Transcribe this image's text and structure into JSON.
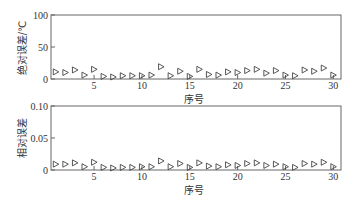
{
  "chart_data": [
    {
      "type": "scatter",
      "title": "",
      "xlabel": "序号",
      "ylabel": "绝对误差/℃",
      "xlim": [
        0.5,
        30.8
      ],
      "ylim": [
        0,
        100
      ],
      "xticks": [
        5,
        10,
        15,
        20,
        25,
        30
      ],
      "yticks": [
        0,
        50,
        100
      ],
      "ytick_labels": [
        "0",
        "50",
        "100"
      ],
      "marker": "right-triangle-open",
      "grid": false,
      "x": [
        1,
        2,
        3,
        4,
        5,
        6,
        7,
        8,
        9,
        10,
        11,
        12,
        13,
        14,
        15,
        16,
        17,
        18,
        19,
        20,
        21,
        22,
        23,
        24,
        25,
        26,
        27,
        28,
        29,
        30
      ],
      "values": [
        8,
        7,
        11,
        3,
        12,
        1,
        0,
        2,
        2,
        2,
        3,
        16,
        2,
        9,
        1,
        12,
        4,
        3,
        8,
        7,
        10,
        12,
        6,
        10,
        3,
        2,
        11,
        9,
        14,
        3
      ]
    },
    {
      "type": "scatter",
      "title": "",
      "xlabel": "序号",
      "ylabel": "相对误差",
      "xlim": [
        0.5,
        30.8
      ],
      "ylim": [
        0,
        0.1
      ],
      "xticks": [
        5,
        10,
        15,
        20,
        25,
        30
      ],
      "yticks": [
        0,
        0.05,
        0.1
      ],
      "ytick_labels": [
        "0",
        "0.05",
        "0.10"
      ],
      "marker": "right-triangle-open",
      "grid": false,
      "x": [
        1,
        2,
        3,
        4,
        5,
        6,
        7,
        8,
        9,
        10,
        11,
        12,
        13,
        14,
        15,
        16,
        17,
        18,
        19,
        20,
        21,
        22,
        23,
        24,
        25,
        26,
        27,
        28,
        29,
        30
      ],
      "values": [
        0.006,
        0.006,
        0.008,
        0.002,
        0.009,
        0.001,
        0.0,
        0.001,
        0.001,
        0.002,
        0.002,
        0.011,
        0.002,
        0.007,
        0.001,
        0.008,
        0.003,
        0.002,
        0.005,
        0.004,
        0.007,
        0.008,
        0.004,
        0.006,
        0.002,
        0.001,
        0.007,
        0.006,
        0.009,
        0.002
      ]
    }
  ],
  "colors": {
    "axis": "#555555",
    "marker": "#444444",
    "text": "#333333"
  }
}
